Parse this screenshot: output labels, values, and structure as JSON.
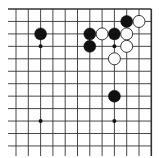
{
  "board": {
    "title": "Go board diagram (top-right corner)",
    "columns": 12,
    "rows": 12,
    "origin_x": 16,
    "origin_y": 9,
    "spacing_x": 12.3,
    "spacing_y": 12.45,
    "edges": {
      "top": true,
      "right": true,
      "left": false,
      "bottom": false
    },
    "line_color": "#333333",
    "stone_black": "#111111",
    "stone_white": "#ffffff",
    "stone_white_stroke": "#222222",
    "star_points": [
      {
        "col": 2,
        "row": 3
      },
      {
        "col": 8,
        "row": 3
      },
      {
        "col": 2,
        "row": 9
      },
      {
        "col": 8,
        "row": 9
      }
    ],
    "stones": [
      {
        "color": "black",
        "col": 9,
        "row": 1
      },
      {
        "color": "white",
        "col": 10,
        "row": 1
      },
      {
        "color": "black",
        "col": 2,
        "row": 2
      },
      {
        "color": "black",
        "col": 6,
        "row": 2
      },
      {
        "color": "white",
        "col": 7,
        "row": 2
      },
      {
        "color": "black",
        "col": 8,
        "row": 2
      },
      {
        "color": "white",
        "col": 9,
        "row": 2
      },
      {
        "color": "black",
        "col": 6,
        "row": 3
      },
      {
        "color": "white",
        "col": 9,
        "row": 3
      },
      {
        "color": "white",
        "col": 8,
        "row": 4
      },
      {
        "color": "black",
        "col": 8,
        "row": 7
      }
    ]
  }
}
